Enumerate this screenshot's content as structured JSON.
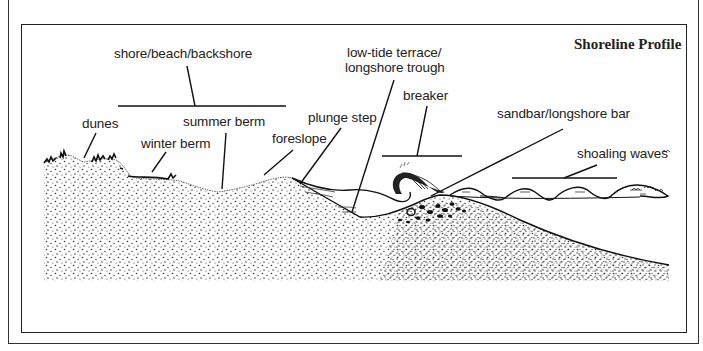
{
  "diagram": {
    "title": "Shoreline Profile",
    "labels": {
      "shore": "shore/beach/backshore",
      "dunes": "dunes",
      "winter_berm": "winter berm",
      "summer_berm": "summer berm",
      "foreslope": "foreslope",
      "plunge_step": "plunge step",
      "low_tide_line1": "low-tide terrace/",
      "low_tide_line2": "longshore trough",
      "breaker": "breaker",
      "sandbar": "sandbar/longshore bar",
      "shoaling": "shoaling waves"
    },
    "colors": {
      "ink": "#222222",
      "background": "#ffffff"
    }
  }
}
